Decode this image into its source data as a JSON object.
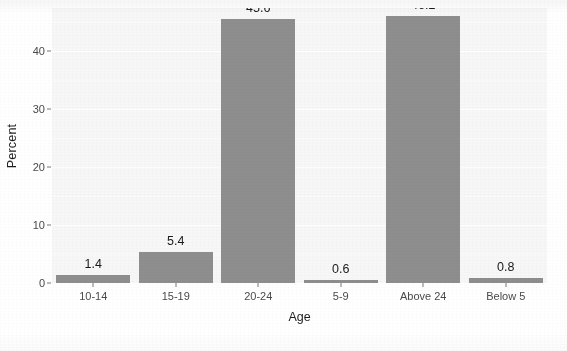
{
  "chart_data": {
    "type": "bar",
    "title": "",
    "subtitle": "",
    "xlabel": "Age",
    "ylabel": "Percent",
    "categories": [
      "10-14",
      "15-19",
      "20-24",
      "5-9",
      "Above 24",
      "Below 5"
    ],
    "values": [
      1.4,
      5.4,
      45.6,
      0.6,
      46.2,
      0.8
    ],
    "data_labels": [
      "1.4",
      "5.4",
      "45.6",
      "0.6",
      "46.2",
      "0.8"
    ],
    "ylim": [
      0,
      47.5
    ],
    "y_ticks": [
      0,
      10,
      20,
      30,
      40
    ],
    "y_tick_labels": [
      "0",
      "10",
      "20",
      "30",
      "40"
    ],
    "grid": true,
    "grid_minor_ticks": [
      5,
      15,
      25,
      35,
      45
    ],
    "legend": "none",
    "legend_position": "none",
    "bar_color": "#8e8e8e",
    "panel_background": "#f7f7f7",
    "gridline_color": "#ffffff",
    "text_color": "#1d1d1d",
    "tick_label_color": "#4a4a4a"
  },
  "figure": {
    "name": "percent-by-age-bar-chart"
  }
}
